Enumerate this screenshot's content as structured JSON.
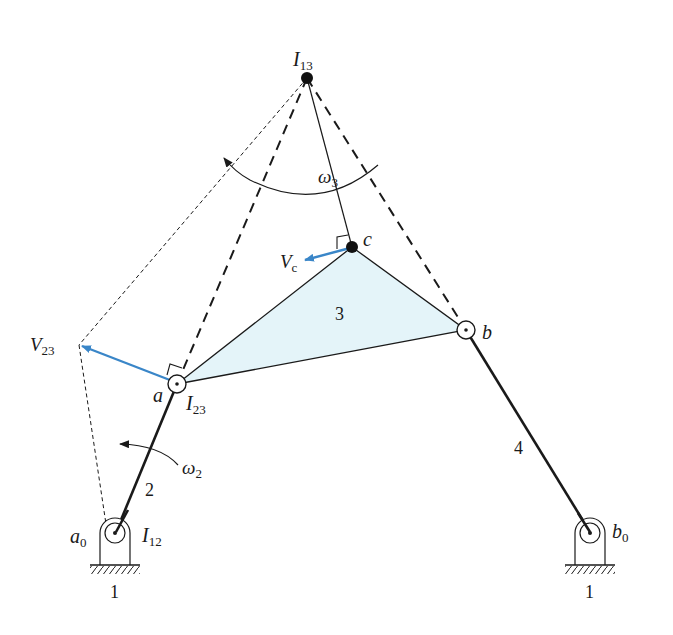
{
  "diagram": {
    "type": "four-bar linkage instant center velocity analysis",
    "colors": {
      "coupler_fill": "#e4f4f9",
      "velocity_arrow": "#3a86c8",
      "line": "#1a1a1a"
    },
    "points": {
      "I13": {
        "label": "I",
        "sub": "13"
      },
      "a": {
        "label": "a"
      },
      "I23": {
        "label": "I",
        "sub": "23"
      },
      "b": {
        "label": "b"
      },
      "c": {
        "label": "c"
      },
      "a0": {
        "label": "a",
        "sub": "0"
      },
      "I12": {
        "label": "I",
        "sub": "12"
      },
      "b0": {
        "label": "b",
        "sub": "0"
      }
    },
    "links": {
      "ground_left": "1",
      "ground_right": "1",
      "crank": "2",
      "coupler": "3",
      "rocker": "4"
    },
    "angular_velocities": {
      "w2": {
        "label": "ω",
        "sub": "2"
      },
      "w3": {
        "label": "ω",
        "sub": "3"
      }
    },
    "velocities": {
      "V23": {
        "label": "V",
        "sub": "23"
      },
      "Vc": {
        "label": "V",
        "sub": "c"
      }
    }
  }
}
